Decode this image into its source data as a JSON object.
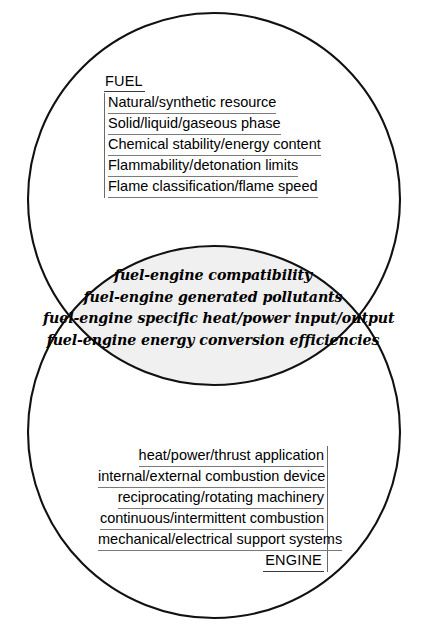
{
  "diagram": {
    "type": "venn",
    "colors": {
      "stroke": "#111111",
      "intersection_fill": "#f0f0f0",
      "background": "#ffffff",
      "rule": "#7a7a7a"
    },
    "geometry": {
      "circle_top": {
        "cx": 214,
        "cy": 199,
        "r": 186
      },
      "circle_bottom": {
        "cx": 214,
        "cy": 432,
        "r": 186
      },
      "stroke_width": 2.1
    }
  },
  "fuel": {
    "title": "FUEL",
    "items": [
      "Natural/synthetic resource",
      "Solid/liquid/gaseous phase",
      "Chemical stability/energy content",
      "Flammability/detonation limits",
      "Flame classification/flame speed"
    ]
  },
  "intersection": {
    "items": [
      "fuel-engine compatibility",
      "fuel-engine generated pollutants",
      "fuel-engine specific heat/power input/output",
      "fuel-engine energy conversion efficiencies"
    ]
  },
  "engine": {
    "title": "ENGINE",
    "items": [
      "heat/power/thrust application",
      "internal/external combustion device",
      "reciprocating/rotating machinery",
      "continuous/intermittent  combustion",
      "mechanical/electrical support systems"
    ]
  }
}
